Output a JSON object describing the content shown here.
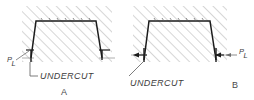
{
  "diagram": {
    "background_color": "#ffffff",
    "line_color": "#1b1b1b",
    "hatch_color": "#b4b4b4",
    "text_color": "#3d3d3d"
  },
  "figures": [
    {
      "id": "a",
      "caption": "A",
      "undercut_label": "UNDERCUT",
      "parting_line_label_top": "P",
      "parting_line_label_bottom": "L",
      "leader_style": "elbow",
      "pl_position": "left"
    },
    {
      "id": "b",
      "caption": "B",
      "undercut_label": "UNDERCUT",
      "parting_line_label_top": "P",
      "parting_line_label_bottom": "L",
      "leader_style": "diagonal",
      "pl_position": "right"
    }
  ]
}
